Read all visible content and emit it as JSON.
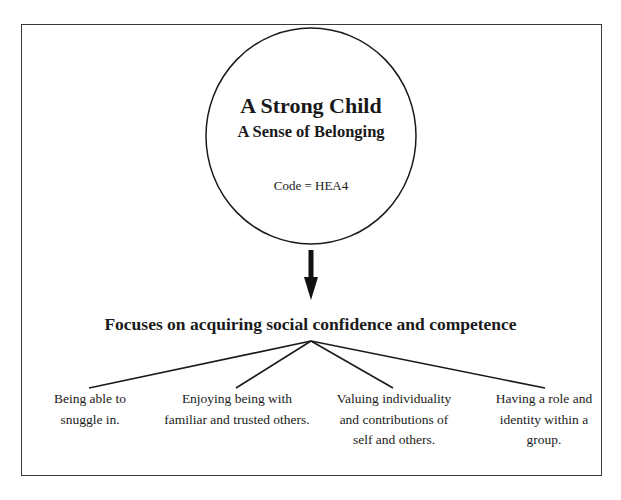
{
  "diagram": {
    "root": {
      "title": "A Strong Child",
      "subtitle": "A Sense of Belonging",
      "code": "Code = HEA4"
    },
    "focus_heading": "Focuses on acquiring social confidence and competence",
    "leaves": [
      {
        "lines": [
          "Being able to",
          "snuggle in."
        ]
      },
      {
        "lines": [
          "Enjoying being with",
          "familiar and trusted others."
        ]
      },
      {
        "lines": [
          "Valuing individuality",
          "and contributions of",
          "self and others."
        ]
      },
      {
        "lines": [
          "Having a role and",
          "identity within a",
          "group."
        ]
      }
    ],
    "colors": {
      "line": "#1a1a1a",
      "border": "#3a3a3a",
      "background": "#ffffff"
    }
  }
}
